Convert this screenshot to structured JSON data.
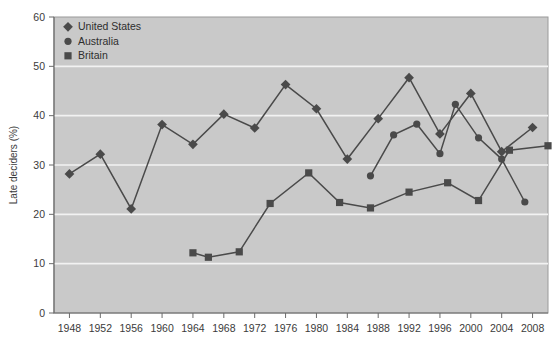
{
  "chart_data": {
    "type": "line",
    "title": "",
    "xlabel": "",
    "ylabel": "Late deciders (%)",
    "ylim": [
      0,
      60
    ],
    "ytick_labels": [
      "0",
      "10",
      "20",
      "30",
      "40",
      "50",
      "60"
    ],
    "ytick_values": [
      0,
      10,
      20,
      30,
      40,
      50,
      60
    ],
    "xlim": [
      1946,
      2010
    ],
    "xtick_labels": [
      "1948",
      "1952",
      "1956",
      "1960",
      "1964",
      "1968",
      "1972",
      "1976",
      "1980",
      "1984",
      "1988",
      "1992",
      "1996",
      "2000",
      "2004",
      "2008"
    ],
    "xtick_values": [
      1948,
      1952,
      1956,
      1960,
      1964,
      1968,
      1972,
      1976,
      1980,
      1984,
      1988,
      1992,
      1996,
      2000,
      2004,
      2008
    ],
    "grid": "horizontal-only-white",
    "legend_position": "top-left-inside",
    "plot_background": "#c9c9c9",
    "gridline_color": "#f2f2f2",
    "series_color": "#4a4a4a",
    "series": [
      {
        "name": "United States",
        "marker": "diamond",
        "points": [
          {
            "x": 1948,
            "y": 28.2
          },
          {
            "x": 1952,
            "y": 32.2
          },
          {
            "x": 1956,
            "y": 21.1
          },
          {
            "x": 1960,
            "y": 38.2
          },
          {
            "x": 1964,
            "y": 34.2
          },
          {
            "x": 1968,
            "y": 40.3
          },
          {
            "x": 1972,
            "y": 37.5
          },
          {
            "x": 1976,
            "y": 46.3
          },
          {
            "x": 1980,
            "y": 41.4
          },
          {
            "x": 1984,
            "y": 31.2
          },
          {
            "x": 1988,
            "y": 39.4
          },
          {
            "x": 1992,
            "y": 47.7
          },
          {
            "x": 1996,
            "y": 36.3
          },
          {
            "x": 2000,
            "y": 44.5
          },
          {
            "x": 2004,
            "y": 32.7
          },
          {
            "x": 2008,
            "y": 37.6
          }
        ]
      },
      {
        "name": "Australia",
        "marker": "circle",
        "points": [
          {
            "x": 1987,
            "y": 27.8
          },
          {
            "x": 1990,
            "y": 36.1
          },
          {
            "x": 1993,
            "y": 38.3
          },
          {
            "x": 1996,
            "y": 32.3
          },
          {
            "x": 1998,
            "y": 42.3
          },
          {
            "x": 2001,
            "y": 35.5
          },
          {
            "x": 2004,
            "y": 31.2
          },
          {
            "x": 2007,
            "y": 22.5
          }
        ]
      },
      {
        "name": "Britain",
        "marker": "square",
        "points": [
          {
            "x": 1964,
            "y": 12.2
          },
          {
            "x": 1966,
            "y": 11.3
          },
          {
            "x": 1970,
            "y": 12.4
          },
          {
            "x": 1974,
            "y": 22.2
          },
          {
            "x": 1979,
            "y": 28.4
          },
          {
            "x": 1983,
            "y": 22.4
          },
          {
            "x": 1987,
            "y": 21.3
          },
          {
            "x": 1992,
            "y": 24.5
          },
          {
            "x": 1997,
            "y": 26.4
          },
          {
            "x": 2001,
            "y": 22.8
          },
          {
            "x": 2005,
            "y": 33.0
          },
          {
            "x": 2010,
            "y": 33.9
          }
        ]
      }
    ]
  },
  "legend": {
    "entries": [
      {
        "label": "United States",
        "marker": "diamond"
      },
      {
        "label": "Australia",
        "marker": "circle"
      },
      {
        "label": "Britain",
        "marker": "square"
      }
    ]
  }
}
